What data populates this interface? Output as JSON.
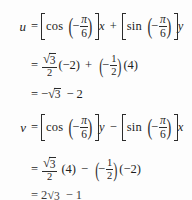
{
  "document": {
    "type": "math-derivation",
    "subject": "rotation of axes formulas",
    "background_color": "#fdfdfd",
    "text_color": "#1d1d1d",
    "last_line_clipped": true
  },
  "symbols": {
    "equals": "=",
    "plus": "+",
    "minus": "−",
    "pi": "π",
    "radical": "√"
  },
  "equations": [
    {
      "id": "line1",
      "lhs": "u",
      "relation": "=",
      "terms": [
        {
          "bracket": "square",
          "function": "cos",
          "argument_sign": "−",
          "argument_num": "π",
          "argument_den": "6"
        },
        {
          "variable": "x"
        },
        {
          "operator": "+"
        },
        {
          "bracket": "square",
          "function": "sin",
          "argument_sign": "−",
          "argument_num": "π",
          "argument_den": "6"
        },
        {
          "variable": "y"
        }
      ],
      "plain_text": "u = [cos(-pi/6)]x + [sin(-pi/6)]y"
    },
    {
      "id": "line2",
      "lhs": "",
      "relation": "=",
      "fraction_num": "√3",
      "fraction_den": "2",
      "factor1": "(−2)",
      "operator": "+",
      "fraction2_sign": "−",
      "fraction2_num": "1",
      "fraction2_den": "2",
      "factor2": "(4)",
      "plain_text": "= (sqrt3/2)(-2) + (-1/2)(4)"
    },
    {
      "id": "line3",
      "lhs": "",
      "relation": "=",
      "value": "−√3 − 2",
      "plain_text": "= -sqrt3 - 2"
    },
    {
      "id": "line4",
      "lhs": "v",
      "relation": "=",
      "terms": [
        {
          "bracket": "square",
          "function": "cos",
          "argument_sign": "−",
          "argument_num": "π",
          "argument_den": "6"
        },
        {
          "variable": "y"
        },
        {
          "operator": "−"
        },
        {
          "bracket": "square",
          "function": "sin",
          "argument_sign": "−",
          "argument_num": "π",
          "argument_den": "6"
        },
        {
          "variable": "x"
        }
      ],
      "plain_text": "v = [cos(-pi/6)]y - [sin(-pi/6)]x"
    },
    {
      "id": "line5",
      "lhs": "",
      "relation": "=",
      "fraction_num": "√3",
      "fraction_den": "2",
      "factor1": "(4)",
      "operator": "−",
      "fraction2_sign": "−",
      "fraction2_num": "1",
      "fraction2_den": "2",
      "factor2": "(−2)",
      "plain_text": "= (sqrt3/2)(4) - (-1/2)(-2)"
    },
    {
      "id": "line6",
      "lhs": "",
      "relation": "=",
      "value": "2√3 − 1",
      "clipped": true,
      "plain_text": "= 2sqrt3 - 1"
    }
  ],
  "literals": {
    "cos": "cos",
    "sin": "sin",
    "var_u": "u",
    "var_v": "v",
    "var_x": "x",
    "var_y": "y",
    "pi": "π",
    "six": "6",
    "two": "2",
    "one": "1",
    "three": "3",
    "minus": "−",
    "plus": "+",
    "eq": "=",
    "neg_two_paren": "(−2)",
    "four_paren": "(4)",
    "neg_sqrt3_minus_2": "−√3 − 2",
    "two_sqrt3_minus_1": "2√3 − 1"
  }
}
